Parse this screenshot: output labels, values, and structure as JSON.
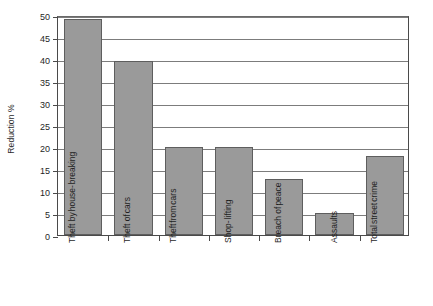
{
  "chart_data": {
    "type": "bar",
    "title": "",
    "xlabel": "",
    "ylabel": "Reduction %",
    "categories": [
      "Theft by house-breaking",
      "Theft of cars",
      "Theft from cars",
      "Shop-lifting",
      "Breach of peace",
      "Assaults",
      "Total street crime"
    ],
    "category_label_lines": [
      [
        "Theft by",
        "house-",
        "breaking"
      ],
      [
        "Theft of",
        "cars"
      ],
      [
        "Theft",
        "from",
        "cars"
      ],
      [
        "Shop-",
        "lifting"
      ],
      [
        "Breach of",
        "peace"
      ],
      [
        "Assaults"
      ],
      [
        "Total",
        "street",
        "crime"
      ]
    ],
    "values": [
      49,
      39.5,
      20,
      20,
      12.8,
      5,
      18
    ],
    "ylim": [
      0,
      50
    ],
    "ytick_values": [
      0,
      5,
      10,
      15,
      20,
      25,
      30,
      35,
      40,
      45,
      50
    ],
    "ytick_labels": [
      "0",
      "5",
      "10",
      "15",
      "20",
      "25",
      "30",
      "35",
      "40",
      "45",
      "50"
    ],
    "grid": true,
    "grid_axis": "y",
    "legend": false,
    "legend_position": "none",
    "bar_color": "#9a9a9a",
    "bar_edge_color": "#5e5e5e",
    "axis_color": "#4a4a4a",
    "gridline_color": "#7c7c7c",
    "background_color": "#ffffff"
  }
}
